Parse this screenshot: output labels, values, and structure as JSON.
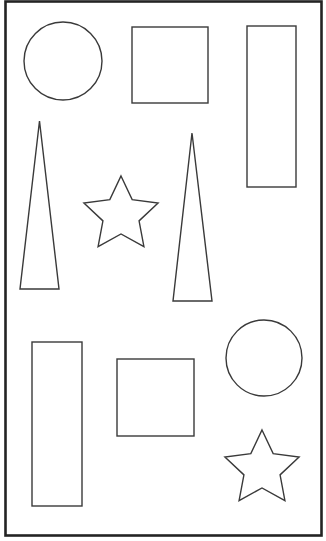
{
  "canvas": {
    "width": 326,
    "height": 541,
    "background": "#ffffff"
  },
  "frame": {
    "x": 5.5,
    "y": 1.5,
    "width": 316,
    "height": 534,
    "stroke": "#232323",
    "stroke_width": 2.6
  },
  "style": {
    "shape_stroke": "#3a3a3a",
    "shape_stroke_width": 1.4,
    "shape_fill": "none"
  },
  "shapes": [
    {
      "name": "circle-top-left",
      "type": "circle",
      "cx": 63,
      "cy": 61,
      "r": 39
    },
    {
      "name": "square-top-middle",
      "type": "rect",
      "x": 132,
      "y": 27,
      "width": 76,
      "height": 76
    },
    {
      "name": "rectangle-top-right",
      "type": "rect",
      "x": 247,
      "y": 26,
      "width": 49,
      "height": 161
    },
    {
      "name": "triangle-left",
      "type": "polygon",
      "points": [
        [
          39.5,
          121
        ],
        [
          59,
          289
        ],
        [
          20,
          289
        ]
      ]
    },
    {
      "name": "star-middle",
      "type": "star",
      "cx": 121,
      "cy": 215,
      "outer_r": 39,
      "inner_r": 19,
      "rotation": 0
    },
    {
      "name": "triangle-middle",
      "type": "polygon",
      "points": [
        [
          192,
          133
        ],
        [
          212,
          301
        ],
        [
          173,
          301
        ]
      ]
    },
    {
      "name": "rectangle-bottom-left",
      "type": "rect",
      "x": 32,
      "y": 342,
      "width": 50,
      "height": 164
    },
    {
      "name": "square-bottom-middle",
      "type": "rect",
      "x": 117,
      "y": 359,
      "width": 77,
      "height": 77
    },
    {
      "name": "circle-bottom-right",
      "type": "circle",
      "cx": 264,
      "cy": 358,
      "r": 38
    },
    {
      "name": "star-bottom-right",
      "type": "star",
      "cx": 262,
      "cy": 469,
      "outer_r": 39,
      "inner_r": 19,
      "rotation": 0
    }
  ]
}
